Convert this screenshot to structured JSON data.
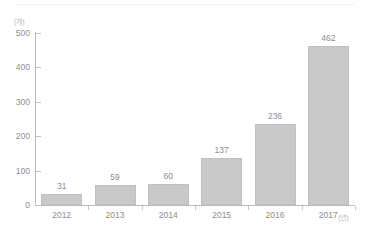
{
  "chart_data": {
    "type": "bar",
    "title": "",
    "subtitle": "",
    "xlabel": "(년)",
    "ylabel": "(개)",
    "categories": [
      "2012",
      "2013",
      "2014",
      "2015",
      "2016",
      "2017"
    ],
    "values": [
      31,
      59,
      60,
      137,
      236,
      462
    ],
    "series": [
      {
        "name": "",
        "values": [
          31,
          59,
          60,
          137,
          236,
          462
        ]
      }
    ],
    "data_labels": [
      "31",
      "59",
      "60",
      "137",
      "236",
      "462"
    ],
    "ylim": [
      0,
      500
    ],
    "yticks": [
      0,
      100,
      200,
      300,
      400,
      500
    ],
    "ytick_labels": [
      "0",
      "100",
      "200",
      "300",
      "400",
      "500"
    ],
    "grid": false,
    "legend": null,
    "legend_position": "none",
    "bar_color": "#c9c9c9",
    "bar_border_color": "#c0c0c0",
    "axis_color": "#bcbcc0",
    "text_color": "#8e8e92",
    "unit_text_color": "#b9b9bd",
    "background": "#ffffff"
  }
}
